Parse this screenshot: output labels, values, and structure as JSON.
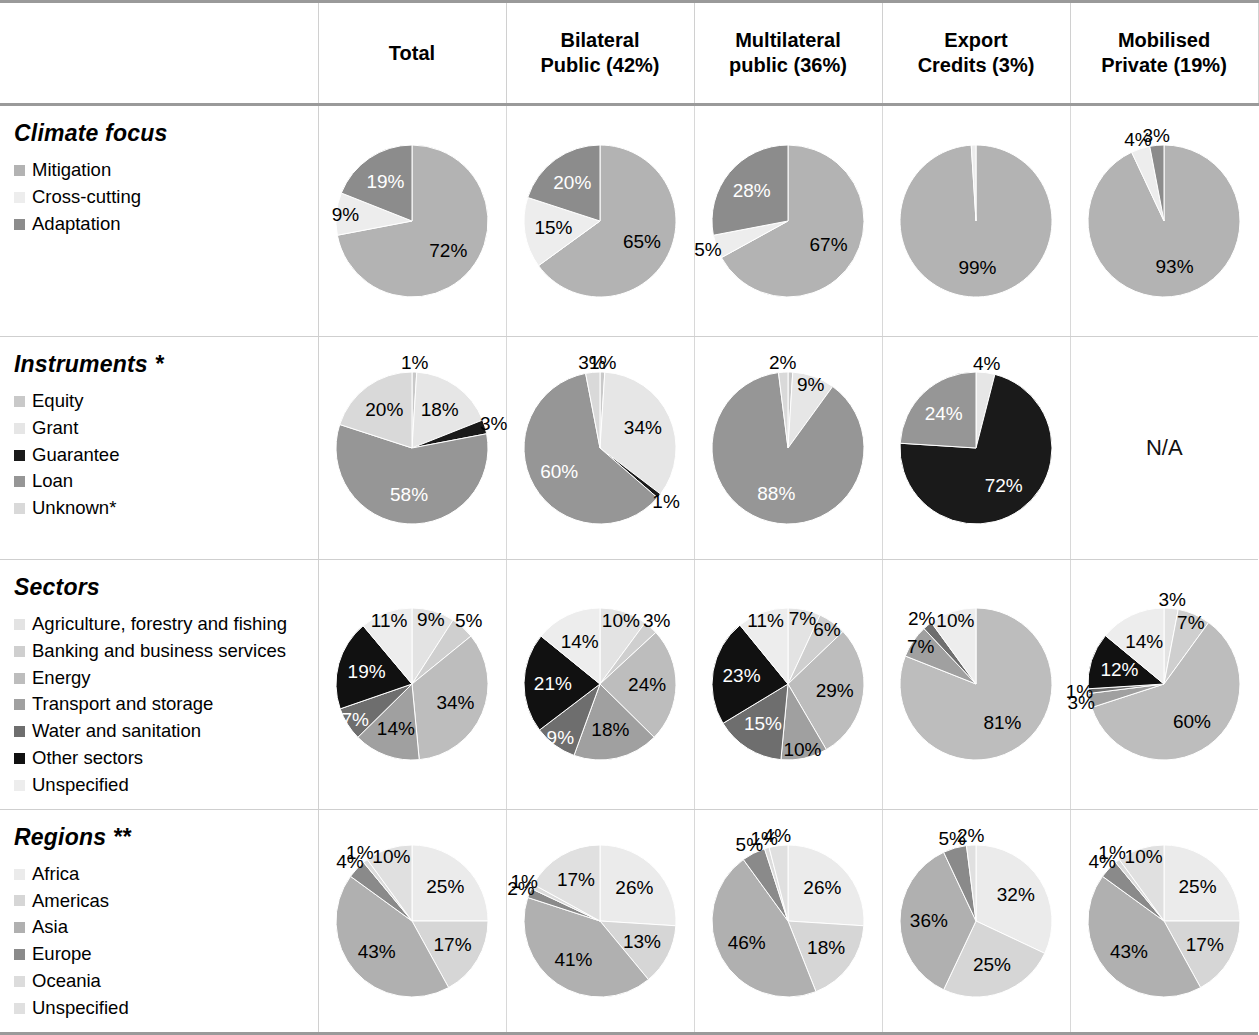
{
  "table": {
    "columns": [
      {
        "id": "total",
        "line1": "Total",
        "line2": ""
      },
      {
        "id": "bilateral",
        "line1": "Bilateral",
        "line2": "Public (42%)"
      },
      {
        "id": "multilateral",
        "line1": "Multilateral",
        "line2": "public (36%)"
      },
      {
        "id": "export",
        "line1": "Export",
        "line2": "Credits (3%)"
      },
      {
        "id": "mobilised",
        "line1": "Mobilised",
        "line2": "Private (19%)"
      }
    ],
    "na_label": "N/A"
  },
  "palette": {
    "climate": [
      "#b3b3b3",
      "#ededed",
      "#8c8c8c"
    ],
    "instruments": [
      "#c9c9c9",
      "#e6e6e6",
      "#1a1a1a",
      "#969696",
      "#d9d9d9"
    ],
    "sectors": [
      "#e3e3e3",
      "#cfcfcf",
      "#bdbdbd",
      "#a0a0a0",
      "#6e6e6e",
      "#111111",
      "#ededed"
    ],
    "regions": [
      "#ebebeb",
      "#d6d6d6",
      "#b0b0b0",
      "#8a8a8a",
      "#dcdcdc",
      "#e0e0e0"
    ],
    "rule": "#9a9a9a",
    "divider": "#d0d0d0"
  },
  "rows": [
    {
      "id": "climate-focus",
      "title": "Climate focus",
      "legend": [
        "Mitigation",
        "Cross-cutting",
        "Adaptation"
      ]
    },
    {
      "id": "instruments",
      "title": "Instruments *",
      "legend": [
        "Equity",
        "Grant",
        "Guarantee",
        "Loan",
        "Unknown*"
      ]
    },
    {
      "id": "sectors",
      "title": "Sectors",
      "legend": [
        "Agriculture, forestry and fishing",
        "Banking and business services",
        "Energy",
        "Transport and storage",
        "Water and sanitation",
        "Other sectors",
        "Unspecified"
      ]
    },
    {
      "id": "regions",
      "title": "Regions **",
      "legend": [
        "Africa",
        "Americas",
        "Asia",
        "Europe",
        "Oceania",
        "Unspecified"
      ]
    }
  ],
  "chart_data": [
    {
      "type": "pie",
      "title": "Climate focus — Total",
      "row": "climate-focus",
      "column": "Total",
      "categories": [
        "Mitigation",
        "Cross-cutting",
        "Adaptation"
      ],
      "values": [
        72,
        9,
        19
      ],
      "labels": [
        "72%",
        "9%",
        "19%"
      ]
    },
    {
      "type": "pie",
      "title": "Climate focus — Bilateral Public (42%)",
      "row": "climate-focus",
      "column": "Bilateral Public (42%)",
      "categories": [
        "Mitigation",
        "Cross-cutting",
        "Adaptation"
      ],
      "values": [
        65,
        15,
        20
      ],
      "labels": [
        "65%",
        "15%",
        "20%"
      ]
    },
    {
      "type": "pie",
      "title": "Climate focus — Multilateral public (36%)",
      "row": "climate-focus",
      "column": "Multilateral public (36%)",
      "categories": [
        "Mitigation",
        "Cross-cutting",
        "Adaptation"
      ],
      "values": [
        67,
        5,
        28
      ],
      "labels": [
        "67%",
        "5%",
        "28%"
      ]
    },
    {
      "type": "pie",
      "title": "Climate focus — Export Credits (3%)",
      "row": "climate-focus",
      "column": "Export Credits (3%)",
      "categories": [
        "Mitigation",
        "Cross-cutting",
        "Adaptation"
      ],
      "values": [
        99,
        1,
        0
      ],
      "labels": [
        "99%",
        "",
        ""
      ]
    },
    {
      "type": "pie",
      "title": "Climate focus — Mobilised Private (19%)",
      "row": "climate-focus",
      "column": "Mobilised Private (19%)",
      "categories": [
        "Mitigation",
        "Cross-cutting",
        "Adaptation"
      ],
      "values": [
        93,
        4,
        3
      ],
      "labels": [
        "93%",
        "4%",
        "3%"
      ]
    },
    {
      "type": "pie",
      "title": "Instruments — Total",
      "row": "instruments",
      "column": "Total",
      "categories": [
        "Equity",
        "Grant",
        "Guarantee",
        "Loan",
        "Unknown*"
      ],
      "values": [
        1,
        18,
        3,
        58,
        20
      ],
      "labels": [
        "1%",
        "18%",
        "3%",
        "58%",
        "20%"
      ]
    },
    {
      "type": "pie",
      "title": "Instruments — Bilateral Public (42%)",
      "row": "instruments",
      "column": "Bilateral Public (42%)",
      "categories": [
        "Equity",
        "Grant",
        "Guarantee",
        "Loan",
        "Unknown*"
      ],
      "values": [
        1,
        34,
        1,
        60,
        3
      ],
      "labels": [
        "1%",
        "34%",
        "1%",
        "60%",
        "3%"
      ]
    },
    {
      "type": "pie",
      "title": "Instruments — Multilateral public (36%)",
      "row": "instruments",
      "column": "Multilateral public (36%)",
      "categories": [
        "Equity",
        "Grant",
        "Guarantee",
        "Loan",
        "Unknown*"
      ],
      "values": [
        1,
        9,
        0,
        88,
        2
      ],
      "labels": [
        "",
        "9%",
        "",
        "88%",
        "2%"
      ]
    },
    {
      "type": "pie",
      "title": "Instruments — Export Credits (3%)",
      "row": "instruments",
      "column": "Export Credits (3%)",
      "categories": [
        "Equity",
        "Grant",
        "Guarantee",
        "Loan",
        "Unknown*"
      ],
      "values": [
        0,
        4,
        72,
        24,
        0
      ],
      "labels": [
        "",
        "4%",
        "72%",
        "24%",
        ""
      ]
    },
    {
      "type": "pie",
      "title": "Instruments — Mobilised Private (19%)",
      "row": "instruments",
      "column": "Mobilised Private (19%)",
      "categories": [],
      "values": [],
      "labels": [],
      "note": "N/A"
    },
    {
      "type": "pie",
      "title": "Sectors — Total",
      "row": "sectors",
      "column": "Total",
      "categories": [
        "Agriculture, forestry and fishing",
        "Banking and business services",
        "Energy",
        "Transport and storage",
        "Water and sanitation",
        "Other sectors",
        "Unspecified"
      ],
      "values": [
        9,
        5,
        34,
        14,
        7,
        19,
        11
      ],
      "labels": [
        "9%",
        "5%",
        "34%",
        "14%",
        "7%",
        "19%",
        "11%"
      ]
    },
    {
      "type": "pie",
      "title": "Sectors — Bilateral Public (42%)",
      "row": "sectors",
      "column": "Bilateral Public (42%)",
      "categories": [
        "Agriculture, forestry and fishing",
        "Banking and business services",
        "Energy",
        "Transport and storage",
        "Water and sanitation",
        "Other sectors",
        "Unspecified"
      ],
      "values": [
        10,
        3,
        24,
        18,
        9,
        21,
        14
      ],
      "labels": [
        "10%",
        "3%",
        "24%",
        "18%",
        "9%",
        "21%",
        "14%"
      ]
    },
    {
      "type": "pie",
      "title": "Sectors — Multilateral public (36%)",
      "row": "sectors",
      "column": "Multilateral public (36%)",
      "categories": [
        "Agriculture, forestry and fishing",
        "Banking and business services",
        "Energy",
        "Transport and storage",
        "Water and sanitation",
        "Other sectors",
        "Unspecified"
      ],
      "values": [
        7,
        6,
        29,
        10,
        15,
        23,
        11
      ],
      "labels": [
        "7%",
        "6%",
        "29%",
        "10%",
        "15%",
        "23%",
        "11%"
      ]
    },
    {
      "type": "pie",
      "title": "Sectors — Export Credits (3%)",
      "row": "sectors",
      "column": "Export Credits (3%)",
      "categories": [
        "Agriculture, forestry and fishing",
        "Banking and business services",
        "Energy",
        "Transport and storage",
        "Water and sanitation",
        "Other sectors",
        "Unspecified"
      ],
      "values": [
        0,
        0,
        81,
        7,
        2,
        0,
        10
      ],
      "labels": [
        "",
        "",
        "81%",
        "7%",
        "2%",
        "",
        "10%"
      ]
    },
    {
      "type": "pie",
      "title": "Sectors — Mobilised Private (19%)",
      "row": "sectors",
      "column": "Mobilised Private (19%)",
      "categories": [
        "Agriculture, forestry and fishing",
        "Banking and business services",
        "Energy",
        "Transport and storage",
        "Water and sanitation",
        "Other sectors",
        "Unspecified"
      ],
      "values": [
        3,
        7,
        60,
        3,
        1,
        12,
        14
      ],
      "labels": [
        "3%",
        "7%",
        "60%",
        "3%",
        "1%",
        "12%",
        "14%"
      ]
    },
    {
      "type": "pie",
      "title": "Regions — Total",
      "row": "regions",
      "column": "Total",
      "categories": [
        "Africa",
        "Americas",
        "Asia",
        "Europe",
        "Oceania",
        "Unspecified"
      ],
      "values": [
        25,
        17,
        43,
        4,
        1,
        10
      ],
      "labels": [
        "25%",
        "17%",
        "43%",
        "4%",
        "1%",
        "10%"
      ]
    },
    {
      "type": "pie",
      "title": "Regions — Bilateral Public (42%)",
      "row": "regions",
      "column": "Bilateral Public (42%)",
      "categories": [
        "Africa",
        "Americas",
        "Asia",
        "Europe",
        "Oceania",
        "Unspecified"
      ],
      "values": [
        26,
        13,
        41,
        2,
        1,
        17
      ],
      "labels": [
        "26%",
        "13%",
        "41%",
        "2%",
        "1%",
        "17%"
      ]
    },
    {
      "type": "pie",
      "title": "Regions — Multilateral public (36%)",
      "row": "regions",
      "column": "Multilateral public (36%)",
      "categories": [
        "Africa",
        "Americas",
        "Asia",
        "Europe",
        "Oceania",
        "Unspecified"
      ],
      "values": [
        26,
        18,
        46,
        5,
        1,
        4
      ],
      "labels": [
        "26%",
        "18%",
        "46%",
        "5%",
        "1%",
        "4%"
      ]
    },
    {
      "type": "pie",
      "title": "Regions — Export Credits (3%)",
      "row": "regions",
      "column": "Export Credits (3%)",
      "categories": [
        "Africa",
        "Americas",
        "Asia",
        "Europe",
        "Oceania",
        "Unspecified"
      ],
      "values": [
        32,
        25,
        36,
        5,
        0,
        2
      ],
      "labels": [
        "32%",
        "25%",
        "36%",
        "5%",
        "",
        "2%"
      ]
    },
    {
      "type": "pie",
      "title": "Regions — Mobilised Private (19%)",
      "row": "regions",
      "column": "Mobilised Private (19%)",
      "categories": [
        "Africa",
        "Americas",
        "Asia",
        "Europe",
        "Oceania",
        "Unspecified"
      ],
      "values": [
        25,
        17,
        43,
        4,
        1,
        10
      ],
      "labels": [
        "25%",
        "17%",
        "43%",
        "4%",
        "1%",
        "10%"
      ]
    }
  ]
}
